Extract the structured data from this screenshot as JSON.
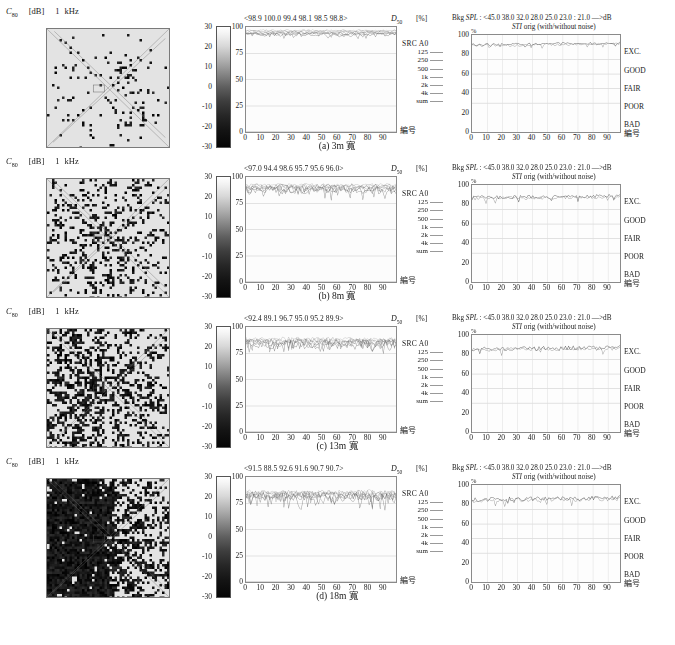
{
  "figure": {
    "width": 675,
    "height": 645,
    "background": "#ffffff"
  },
  "left_panel": {
    "metric": "C",
    "metric_sub": "80",
    "unit": "[dB]",
    "frequency": "1",
    "frequency_unit": "kHz",
    "colorbar": {
      "ticks": [
        "30",
        "20",
        "10",
        "0",
        "-10",
        "-20",
        "-30"
      ],
      "max": 30,
      "min": -30,
      "top_color": "#ffffff",
      "bottom_color": "#050505"
    }
  },
  "middle_panel": {
    "d50_label": "D",
    "d50_sub": "50",
    "percent_label": "[%]",
    "y_ticks": [
      "100",
      "75",
      "50",
      "25",
      "0"
    ],
    "x_ticks": [
      "0",
      "10",
      "20",
      "30",
      "40",
      "50",
      "60",
      "70",
      "80",
      "90"
    ],
    "x_axis_label": "編号",
    "legend_title": "SRC  A0",
    "legend_items": [
      "125",
      "250",
      "500",
      "1k",
      "2k",
      "4k",
      "sum"
    ]
  },
  "right_panel": {
    "bkg_prefix": "Bkg",
    "bkg_spl": "SPL",
    "bkg_values": ": <45.0  38.0  32.0  28.0  25.0  23.0 : 21.0  —>dB",
    "sti_italic": "STI",
    "sti_rest": "orig   (with/without noise)",
    "percent_mark": "%",
    "y_ticks": [
      "100",
      "80",
      "60",
      "40",
      "20",
      "0"
    ],
    "x_ticks": [
      "0",
      "10",
      "20",
      "30",
      "40",
      "50",
      "60",
      "70",
      "80",
      "90"
    ],
    "x_axis_label": "編号",
    "quality_labels": [
      "EXC.",
      "GOOD",
      "FAIR",
      "POOR",
      "BAD"
    ]
  },
  "rows": [
    {
      "caption": "(a)  3m 寬",
      "d50_header": "<98.9  100.0  99.4  98.1  98.5  98.8>",
      "d50_values": [
        98.9,
        100.0,
        99.4,
        98.1,
        98.5,
        98.8
      ],
      "mid_level": 97.5,
      "mid_noise": 2.6,
      "sti_level": 90.0,
      "sti_noise": 1.6,
      "map_density": 0.1,
      "map_spread": 0.3
    },
    {
      "caption": "(b)  8m 寬",
      "d50_header": "<97.0  94.4  98.6  95.7  95.6  96.0>",
      "d50_values": [
        97.0,
        94.4,
        98.6,
        95.7,
        95.6,
        96.0
      ],
      "mid_level": 94.0,
      "mid_noise": 6.0,
      "sti_level": 87.0,
      "sti_noise": 2.4,
      "map_density": 0.3,
      "map_spread": 0.55
    },
    {
      "caption": "(c)  13m 寬",
      "d50_header": "<92.4  89.1  96.7  95.0  95.2  89.9>",
      "d50_values": [
        92.4,
        89.1,
        96.7,
        95.0,
        95.2,
        89.9
      ],
      "mid_level": 90.5,
      "mid_noise": 7.0,
      "sti_level": 85.5,
      "sti_noise": 2.8,
      "map_density": 0.42,
      "map_spread": 0.72
    },
    {
      "caption": "(d)  18m 寬",
      "d50_header": "<91.5  88.5  92.6  91.6  90.7  90.7>",
      "d50_values": [
        91.5,
        88.5,
        92.6,
        91.6,
        90.7,
        90.7
      ],
      "mid_level": 88.0,
      "mid_noise": 8.0,
      "sti_level": 85.0,
      "sti_noise": 3.0,
      "map_density": 0.55,
      "map_spread": 0.9
    }
  ],
  "chart_data": {
    "type": "line",
    "panels_per_row": [
      "C80 spatial map",
      "D50 vs receiver number",
      "STI vs receiver number"
    ],
    "x": "receiver index 0-95",
    "xlabel": "編号",
    "middle": {
      "ylabel": "D50 [%]",
      "ylim": [
        0,
        100
      ],
      "yticks": [
        0,
        25,
        50,
        75,
        100
      ],
      "series_names": [
        "125",
        "250",
        "500",
        "1k",
        "2k",
        "4k",
        "sum"
      ],
      "row_means": [
        [
          98.9,
          100.0,
          99.4,
          98.1,
          98.5,
          98.8
        ],
        [
          97.0,
          94.4,
          98.6,
          95.7,
          95.6,
          96.0
        ],
        [
          92.4,
          89.1,
          96.7,
          95.0,
          95.2,
          89.9
        ],
        [
          91.5,
          88.5,
          92.6,
          91.6,
          90.7,
          90.7
        ]
      ]
    },
    "right": {
      "ylabel": "STI [%]",
      "ylim": [
        0,
        100
      ],
      "yticks": [
        0,
        20,
        40,
        60,
        80,
        100
      ],
      "category_bands": [
        {
          "label": "EXC.",
          "range": [
            75,
            100
          ]
        },
        {
          "label": "GOOD",
          "range": [
            60,
            75
          ]
        },
        {
          "label": "FAIR",
          "range": [
            45,
            60
          ]
        },
        {
          "label": "POOR",
          "range": [
            30,
            45
          ]
        },
        {
          "label": "BAD",
          "range": [
            0,
            30
          ]
        }
      ],
      "bkg_spl_levels": [
        45.0,
        38.0,
        32.0,
        28.0,
        25.0,
        23.0,
        21.0
      ],
      "row_sti_levels": [
        90.0,
        87.0,
        85.5,
        85.0
      ]
    },
    "colorbar": {
      "label": "C80 [dB]",
      "ticks": [
        30,
        20,
        10,
        0,
        -10,
        -20,
        -30
      ]
    }
  }
}
